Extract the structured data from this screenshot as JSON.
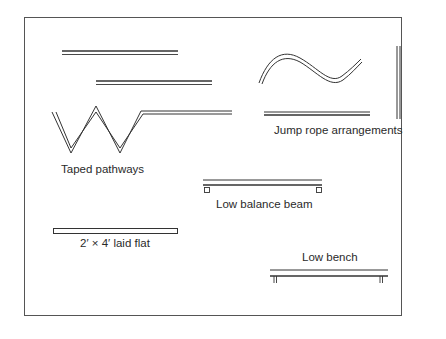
{
  "figure": {
    "labels": {
      "taped_pathways": "Taped pathways",
      "jump_rope": "Jump rope arrangements",
      "balance_beam": "Low balance beam",
      "board": "2′ × 4′ laid flat",
      "bench": "Low bench"
    },
    "colors": {
      "stroke": "#3a3a3a",
      "frame": "#555555",
      "background": "#ffffff"
    }
  }
}
